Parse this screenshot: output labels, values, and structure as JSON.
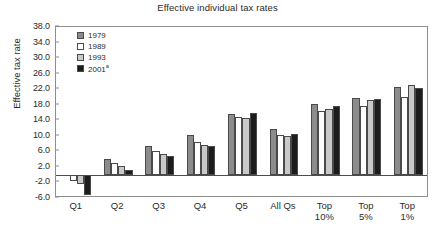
{
  "chart_data": {
    "type": "bar",
    "title": "Effective individual tax rates",
    "xlabel": "",
    "ylabel": "Effective tax rate",
    "ylim": [
      -6.0,
      38.0
    ],
    "yticks": [
      "38.0",
      "34.0",
      "30.0",
      "26.0",
      "22.0",
      "18.0",
      "14.0",
      "10.0",
      "6.0",
      "2.0",
      "-2.0",
      "-6.0"
    ],
    "ytick_values": [
      38.0,
      34.0,
      30.0,
      26.0,
      22.0,
      18.0,
      14.0,
      10.0,
      6.0,
      2.0,
      -2.0,
      -6.0
    ],
    "grid": false,
    "legend_position": "upper-left",
    "categories": [
      "Q1",
      "Q2",
      "Q3",
      "Q4",
      "Q5",
      "All Qs",
      "Top 10%",
      "Top 5%",
      "Top 1%"
    ],
    "category_lines": [
      [
        "Q1"
      ],
      [
        "Q2"
      ],
      [
        "Q3"
      ],
      [
        "Q4"
      ],
      [
        "Q5"
      ],
      [
        "All Qs"
      ],
      [
        "Top",
        "10%"
      ],
      [
        "Top",
        "5%"
      ],
      [
        "Top",
        "1%"
      ]
    ],
    "series": [
      {
        "name": "1979",
        "color": "#8c8c8c",
        "values": [
          0.0,
          4.1,
          7.5,
          10.1,
          15.7,
          11.8,
          18.2,
          19.7,
          22.5
        ]
      },
      {
        "name": "1989",
        "color": "#fdfdfd",
        "values": [
          -1.6,
          2.9,
          6.0,
          8.3,
          14.8,
          10.2,
          16.4,
          17.7,
          20.0
        ]
      },
      {
        "name": "1993",
        "color": "#c9c9c9",
        "values": [
          -2.4,
          2.2,
          5.3,
          7.7,
          14.7,
          10.0,
          17.0,
          19.1,
          23.1
        ]
      },
      {
        "name": "2001a",
        "color": "#1c1c1c",
        "values": [
          -5.3,
          1.3,
          4.8,
          7.5,
          15.8,
          10.5,
          17.8,
          19.6,
          22.4
        ]
      }
    ],
    "legend": [
      {
        "label": "1979",
        "note": "",
        "color": "#8c8c8c"
      },
      {
        "label": "1989",
        "note": "",
        "color": "#fdfdfd"
      },
      {
        "label": "1993",
        "note": "",
        "color": "#c9c9c9"
      },
      {
        "label": "2001",
        "note": "a",
        "color": "#1c1c1c"
      }
    ]
  }
}
